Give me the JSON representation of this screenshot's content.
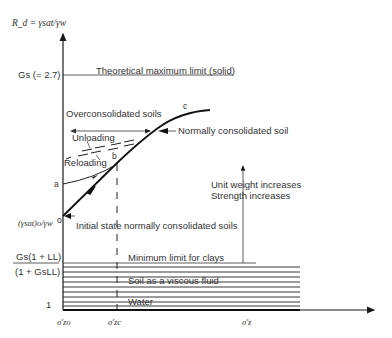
{
  "diagram": {
    "y_axis_label": "R_d = γsat/γw",
    "x_axis_ticks": [
      "σ'zo",
      "σ'zc",
      "σ'z"
    ],
    "y_axis_labels": {
      "gs": "Gs (= 2.7)",
      "initial": "(γsat)o/γw",
      "fraction_num": "Gs(1 + LL)",
      "fraction_den": "(1 + GsLL)",
      "one": "1"
    },
    "points": {
      "o": "o",
      "a": "a",
      "b": "b",
      "c": "c"
    },
    "annotations": {
      "theoretical_max": "Theoretical maximum limit  (solid)",
      "overconsolidated": "Overconsolidated soils",
      "unloading": "Unloading",
      "reloading": "Reloading",
      "normally_consolidated": "Normally consolidated soil",
      "initial_state": "Initial state normally consolidated soils",
      "unit_weight": "Unit weight increases",
      "strength": "Strength increases",
      "min_limit": "Minimum limit for clays",
      "viscous": "Soil as a viscous fluid",
      "water": "Water"
    },
    "colors": {
      "line": "#1a1a1a",
      "text": "#333333",
      "background": "#ffffff"
    }
  }
}
